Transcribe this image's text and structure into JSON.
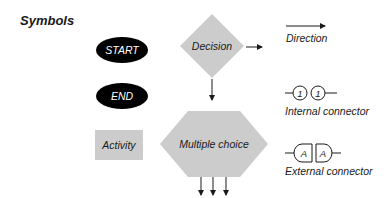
{
  "title": "Symbols",
  "colors": {
    "background": "#ffffff",
    "shape_fill": "#cccccc",
    "terminal_fill": "#000000",
    "stroke": "#1a1a1a",
    "text": "#1a1a1a",
    "terminal_text": "#ffffff"
  },
  "symbols": {
    "start": {
      "label": "START",
      "shape": "ellipse"
    },
    "end": {
      "label": "END",
      "shape": "ellipse"
    },
    "activity": {
      "label": "Activity",
      "shape": "rectangle"
    },
    "decision": {
      "label": "Decision",
      "shape": "diamond"
    },
    "multiple_choice": {
      "label": "Multiple choice",
      "shape": "hexagon"
    }
  },
  "legend": {
    "direction": {
      "label": "Direction",
      "icon": "arrow-right-icon"
    },
    "internal_connector": {
      "label": "Internal connector",
      "icon": "circle-connector-icon",
      "marker_left": "1",
      "marker_right": "1"
    },
    "external_connector": {
      "label": "External connector",
      "icon": "d-shape-connector-icon",
      "marker_left": "A",
      "marker_right": "A"
    }
  }
}
